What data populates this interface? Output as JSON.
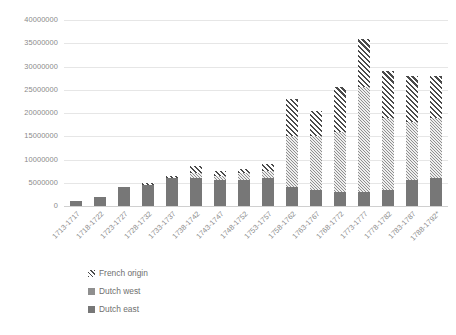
{
  "chart_data": {
    "type": "bar",
    "stacked": true,
    "title": "",
    "subtitle": "",
    "xlabel": "",
    "ylabel": "",
    "ylim": [
      0,
      40000000
    ],
    "ytick_step": 5000000,
    "ytick_labels": [
      "40000000",
      "35000000",
      "30000000",
      "25000000",
      "20000000",
      "15000000",
      "10000000",
      "5000000",
      "0"
    ],
    "ytick_values": [
      40000000,
      35000000,
      30000000,
      25000000,
      20000000,
      15000000,
      10000000,
      5000000,
      0
    ],
    "grid": true,
    "legend_position": "bottom-left",
    "categories": [
      "1713-1717",
      "1718-1722",
      "1723-1727",
      "1728-1732",
      "1733-1737",
      "1738-1742",
      "1743-1747",
      "1748-1752",
      "1753-1757",
      "1758-1762",
      "1763-1767",
      "1768-1772",
      "1773-1777",
      "1778-1782",
      "1783-1787",
      "1788-1792*"
    ],
    "series": [
      {
        "name": "Dutch east",
        "color": "#777777",
        "pattern": "solid",
        "values": [
          1000000,
          2000000,
          4000000,
          4500000,
          6000000,
          6000000,
          5500000,
          5500000,
          6000000,
          4000000,
          3500000,
          3000000,
          3000000,
          3500000,
          5500000,
          6000000
        ]
      },
      {
        "name": "Dutch west",
        "color": "#8f8f8f",
        "pattern": "checker",
        "values": [
          0,
          0,
          0,
          0,
          0,
          1000000,
          1000000,
          1500000,
          1500000,
          11000000,
          11500000,
          13000000,
          22500000,
          15500000,
          12500000,
          13000000
        ]
      },
      {
        "name": "French origin",
        "color": "#4a4a4a",
        "pattern": "diagonal-hatch",
        "values": [
          0,
          0,
          0,
          500000,
          500000,
          1500000,
          1000000,
          1000000,
          1500000,
          8000000,
          5500000,
          9500000,
          10500000,
          10000000,
          10000000,
          9000000
        ]
      }
    ],
    "totals": [
      1000000,
      2000000,
      4000000,
      5000000,
      6500000,
      8500000,
      7500000,
      8000000,
      9000000,
      23000000,
      20500000,
      25500000,
      36000000,
      29000000,
      28000000,
      28000000
    ]
  },
  "legend": {
    "items": [
      {
        "label": "French origin",
        "swatch": "french"
      },
      {
        "label": "Dutch west",
        "swatch": "west"
      },
      {
        "label": "Dutch east",
        "swatch": "east"
      }
    ]
  }
}
